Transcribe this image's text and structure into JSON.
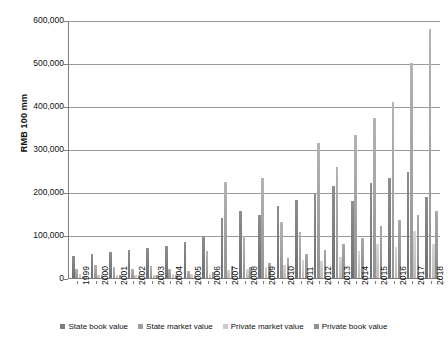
{
  "chart_data": {
    "type": "bar",
    "title": "",
    "subtitle": "",
    "xlabel": "",
    "ylabel": "RMB 100 mm",
    "ylim": [
      0,
      600000
    ],
    "ytick_values": [
      0,
      100000,
      200000,
      300000,
      400000,
      500000,
      600000
    ],
    "ytick_labels": [
      "0",
      "100,000",
      "200,000",
      "300,000",
      "400,000",
      "500,000",
      "600,000"
    ],
    "grid": true,
    "legend_position": "bottom",
    "categories": [
      "1999",
      "2000",
      "2001",
      "2002",
      "2003",
      "2004",
      "2005",
      "2006",
      "2007",
      "2008",
      "2009",
      "2010",
      "2011",
      "2012",
      "2013",
      "2014",
      "2015",
      "2016",
      "2017",
      "2018"
    ],
    "series": [
      {
        "name": "State book value",
        "color": "#7d7d7d",
        "values": [
          52000,
          56000,
          60000,
          65000,
          70000,
          75000,
          83000,
          96000,
          140000,
          155000,
          146000,
          168000,
          182000,
          196000,
          213000,
          178000,
          222000,
          232000,
          246000,
          188000
        ]
      },
      {
        "name": "State market value",
        "color": "#9e9e9e",
        "values": [
          22000,
          30000,
          25000,
          21000,
          27000,
          20000,
          17000,
          62000,
          223000,
          98000,
          232000,
          130000,
          108000,
          315000,
          258000,
          332000,
          371000,
          410000,
          500000,
          580000
        ]
      },
      {
        "name": "Private market value",
        "color": "#cccccc",
        "values": [
          10000,
          7000,
          8000,
          7000,
          8000,
          9000,
          9000,
          10000,
          19000,
          20000,
          26000,
          31000,
          42000,
          40000,
          48000,
          62000,
          80000,
          72000,
          110000,
          78000
        ]
      },
      {
        "name": "Private book value",
        "color": "#919191",
        "values": [
          5000,
          6000,
          6000,
          6000,
          6000,
          7000,
          8000,
          13000,
          27000,
          26000,
          36000,
          46000,
          57000,
          66000,
          80000,
          94000,
          120000,
          135000,
          146000,
          155000
        ]
      }
    ]
  },
  "legend": {
    "items": [
      {
        "label": "State book value"
      },
      {
        "label": "State market value"
      },
      {
        "label": "Private market value"
      },
      {
        "label": "Private book value"
      }
    ]
  }
}
